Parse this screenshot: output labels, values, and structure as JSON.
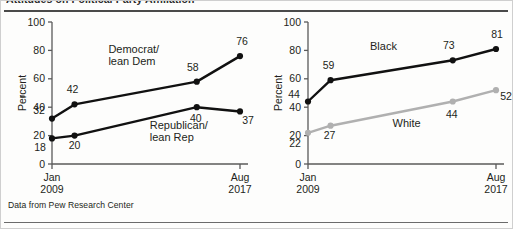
{
  "header": {
    "title_partial": "Attitudes on Political Party Affiliation",
    "rule_color": "#4a4a4a"
  },
  "footer": {
    "source": "Data from Pew Research Center"
  },
  "axis": {
    "y_label": "Percent",
    "y_ticks": [
      "0",
      "20",
      "40",
      "60",
      "80",
      "100"
    ],
    "x_tick_1_line1": "Jan",
    "x_tick_1_line2": "2009",
    "x_tick_2_line1": "Aug",
    "x_tick_2_line2": "2017"
  },
  "colors": {
    "black_series": "#111111",
    "gray_series": "#b0b0b0",
    "axis": "#5a5a5a",
    "text": "#231f20"
  },
  "chart_data": [
    {
      "type": "line",
      "title": "Party affiliation",
      "xlabel": "",
      "ylabel": "Percent",
      "ylim": [
        0,
        100
      ],
      "grid": false,
      "legend": "inline-annotations",
      "x": [
        0,
        0.12,
        0.77,
        1.0
      ],
      "xtick_positions": [
        0,
        1.0
      ],
      "xtick_labels": [
        "Jan 2009",
        "Aug 2017"
      ],
      "series": [
        {
          "name": "Democrat/lean Dem",
          "color": "#111111",
          "values": [
            32,
            42,
            58,
            76
          ],
          "label_line1": "Democrat/",
          "label_line2": "lean Dem",
          "point_labels": [
            "32",
            "42",
            "58",
            "76"
          ]
        },
        {
          "name": "Republican/lean Rep",
          "color": "#111111",
          "values": [
            18,
            20,
            40,
            37
          ],
          "label_line1": "Republican/",
          "label_line2": "lean Rep",
          "point_labels": [
            "18",
            "20",
            "40",
            "37"
          ]
        }
      ]
    },
    {
      "type": "line",
      "title": "By race",
      "xlabel": "",
      "ylabel": "Percent",
      "ylim": [
        0,
        100
      ],
      "grid": false,
      "legend": "inline-annotations",
      "x": [
        0,
        0.12,
        0.77,
        1.0
      ],
      "xtick_positions": [
        0,
        1.0
      ],
      "xtick_labels": [
        "Jan 2009",
        "Aug 2017"
      ],
      "series": [
        {
          "name": "Black",
          "color": "#111111",
          "values": [
            44,
            59,
            73,
            81
          ],
          "label_line1": "Black",
          "label_line2": "",
          "point_labels": [
            "44",
            "59",
            "73",
            "81"
          ]
        },
        {
          "name": "White",
          "color": "#b0b0b0",
          "values": [
            22,
            27,
            44,
            52
          ],
          "label_line1": "White",
          "label_line2": "",
          "point_labels": [
            "22",
            "27",
            "44",
            "52"
          ]
        }
      ]
    }
  ]
}
